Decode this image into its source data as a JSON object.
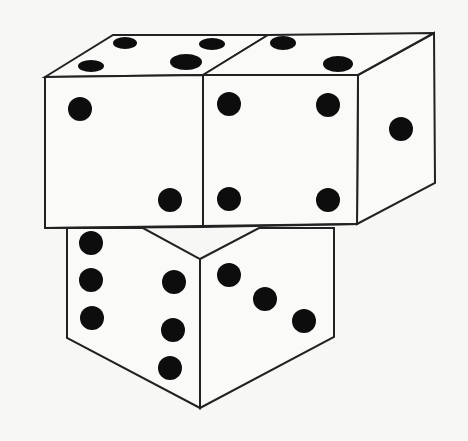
{
  "figure": {
    "colors": {
      "background": "#f7f7f6",
      "face": "#fafaf9",
      "outline": "#222222",
      "pip": "#0d0d0d"
    }
  },
  "dice": [
    {
      "name": "top-left-die",
      "visible_faces": {
        "top": 4,
        "front": 2
      }
    },
    {
      "name": "top-right-die",
      "visible_faces": {
        "top": 2,
        "front": 4,
        "right": 1
      }
    },
    {
      "name": "bottom-die",
      "visible_faces": {
        "left": 6,
        "right": 3
      }
    }
  ]
}
